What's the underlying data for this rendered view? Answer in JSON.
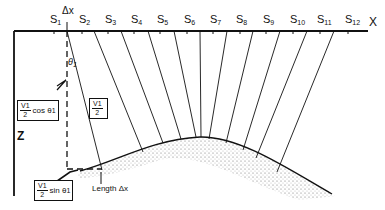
{
  "diagram": {
    "axis_label_x": "X",
    "axis_label_z": "Z",
    "stations": [
      {
        "label": "S",
        "sub": "1",
        "x": 50
      },
      {
        "label": "S",
        "sub": "2",
        "x": 79
      },
      {
        "label": "S",
        "sub": "3",
        "x": 105
      },
      {
        "label": "S",
        "sub": "4",
        "x": 131
      },
      {
        "label": "S",
        "sub": "5",
        "x": 157
      },
      {
        "label": "S",
        "sub": "6",
        "x": 184
      },
      {
        "label": "S",
        "sub": "7",
        "x": 210
      },
      {
        "label": "S",
        "sub": "8",
        "x": 236
      },
      {
        "label": "S",
        "sub": "9",
        "x": 263
      },
      {
        "label": "S",
        "sub": "10",
        "x": 290
      },
      {
        "label": "S",
        "sub": "11",
        "x": 317
      },
      {
        "label": "S",
        "sub": "12",
        "x": 345
      }
    ],
    "delta_x_top": "Δx",
    "theta_label": "θ",
    "theta_sub": "1",
    "box_cos": {
      "num": "V1",
      "den": "2",
      "text": "cos θ",
      "sub": "1"
    },
    "box_v": {
      "num": "V1",
      "den": "2"
    },
    "box_sin": {
      "num": "V1",
      "den": "2",
      "text": "sin θ",
      "sub": "1"
    },
    "length_label": "Length Δx",
    "colors": {
      "line": "#111111",
      "stipple": "#555555"
    }
  }
}
